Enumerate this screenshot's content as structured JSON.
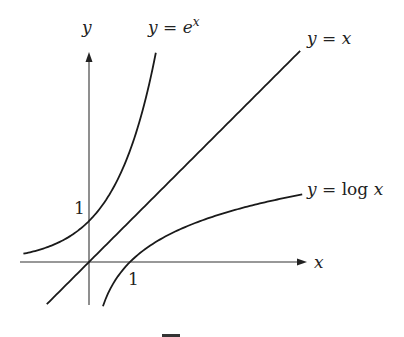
{
  "chart_data": {
    "type": "line",
    "title": "",
    "xlabel": "x",
    "ylabel": "y",
    "x_ticks": [
      "1"
    ],
    "y_ticks": [
      "1"
    ],
    "xlim": [
      -1.7,
      5.3
    ],
    "ylim": [
      -1.05,
      5.2
    ],
    "grid": false,
    "series": [
      {
        "name": "exp",
        "label": "y = e^x",
        "label_parts": {
          "lhs": "y",
          "eq": " = ",
          "base": "e",
          "sup": "x"
        },
        "function": "exp",
        "domain": [
          -1.6,
          1.63
        ]
      },
      {
        "name": "identity",
        "label": "y = x",
        "label_parts": {
          "lhs": "y",
          "eq": " = ",
          "rhs": "x"
        },
        "function": "identity",
        "domain": [
          -1.03,
          5.15
        ]
      },
      {
        "name": "log",
        "label": "y = log x",
        "label_parts": {
          "lhs": "y",
          "eq": " = ",
          "fn": "log ",
          "arg": "x"
        },
        "function": "log",
        "domain": [
          0.34,
          5.2
        ]
      }
    ]
  }
}
